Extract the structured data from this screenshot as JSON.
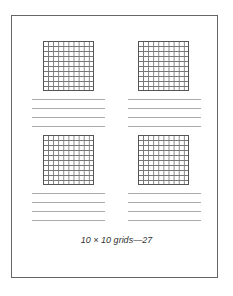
{
  "caption": "10 × 10 grids—27",
  "grids": [
    {
      "rows": 10,
      "cols": 10
    },
    {
      "rows": 10,
      "cols": 10
    },
    {
      "rows": 10,
      "cols": 10
    },
    {
      "rows": 10,
      "cols": 10
    }
  ]
}
